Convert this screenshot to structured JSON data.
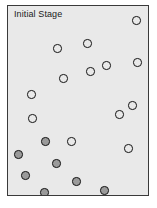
{
  "figure": {
    "title": "Initial Stage",
    "background_color": "#ffffff"
  },
  "plot": {
    "background_color": "#e9e9e9",
    "border_color": "#3a3a3a"
  },
  "legend": {
    "open_label": "unvisited node",
    "filled_label": "visited node",
    "open_fill": "#e9e9e9",
    "filled_fill": "#9a9a9a",
    "outline_color": "#151515"
  },
  "chart_data": {
    "type": "scatter",
    "title": "Initial Stage",
    "xlabel": "",
    "ylabel": "",
    "xlim": [
      0,
      142
    ],
    "ylim": [
      0,
      191
    ],
    "grid": false,
    "legend_position": "none",
    "marker_radius": 4.2,
    "series": [
      {
        "name": "open",
        "marker": "open-circle",
        "fill": "#e9e9e9",
        "edge": "#151515",
        "points": [
          {
            "x": 128.5,
            "y": 14.5
          },
          {
            "x": 49.5,
            "y": 42.5
          },
          {
            "x": 79.5,
            "y": 37.5
          },
          {
            "x": 129.5,
            "y": 56.5
          },
          {
            "x": 98.5,
            "y": 59.5
          },
          {
            "x": 82.5,
            "y": 65.5
          },
          {
            "x": 55.5,
            "y": 72.5
          },
          {
            "x": 23.5,
            "y": 88.5
          },
          {
            "x": 24.5,
            "y": 112.5
          },
          {
            "x": 124.5,
            "y": 99.5
          },
          {
            "x": 111.5,
            "y": 108.5
          },
          {
            "x": 120.5,
            "y": 142.5
          },
          {
            "x": 63.5,
            "y": 135.5
          }
        ]
      },
      {
        "name": "filled",
        "marker": "filled-circle",
        "fill": "#9a9a9a",
        "edge": "#151515",
        "points": [
          {
            "x": 37.5,
            "y": 135.5
          },
          {
            "x": 10.5,
            "y": 148.5
          },
          {
            "x": 48.5,
            "y": 157.5
          },
          {
            "x": 17.5,
            "y": 169.5
          },
          {
            "x": 68.5,
            "y": 175.5
          },
          {
            "x": 36.5,
            "y": 186.5
          },
          {
            "x": 96.5,
            "y": 184.5
          }
        ]
      }
    ]
  }
}
